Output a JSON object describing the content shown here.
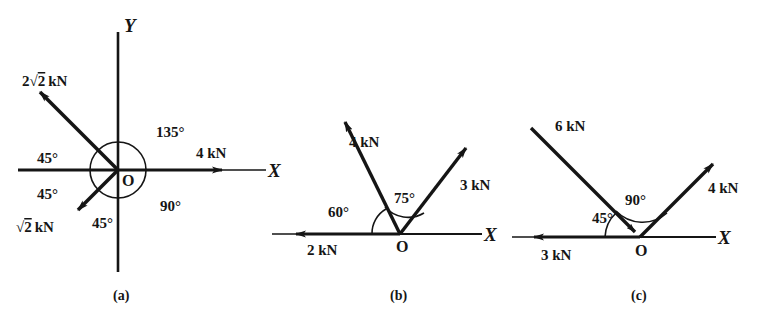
{
  "figure": {
    "units": "kN",
    "stroke_color": "#151515",
    "background": "#ffffff"
  },
  "panels": [
    {
      "id": "a",
      "caption": "(a)",
      "origin_label": "O",
      "axes": [
        {
          "name": "x-axis",
          "label": "X"
        },
        {
          "name": "y-axis",
          "label": "Y"
        }
      ],
      "forces": [
        {
          "name": "force-4kn",
          "magnitude": "4",
          "unit": "kN",
          "label_prefix": "",
          "radical": "",
          "label": "4 kN",
          "direction_deg": 0,
          "points_away": true
        },
        {
          "name": "force-2root2kn",
          "magnitude": "2",
          "unit": "kN",
          "label_prefix": "2",
          "radical": "2",
          "label": "2√2 kN",
          "direction_deg": 135,
          "points_away": true
        },
        {
          "name": "force-root2kn",
          "magnitude": "",
          "unit": "kN",
          "label_prefix": "",
          "radical": "2",
          "label": "√2 kN",
          "direction_deg": 225,
          "points_away": true
        }
      ],
      "angles": [
        {
          "name": "angle-135",
          "value": "135",
          "symbol": "°",
          "label": "135°"
        },
        {
          "name": "angle-90",
          "value": "90",
          "symbol": "°",
          "label": "90°"
        },
        {
          "name": "angle-45-upper-left",
          "value": "45",
          "symbol": "°",
          "label": "45°"
        },
        {
          "name": "angle-45-lower-left",
          "value": "45",
          "symbol": "°",
          "label": "45°"
        },
        {
          "name": "angle-45-bottom",
          "value": "45",
          "symbol": "°",
          "label": "45°"
        }
      ]
    },
    {
      "id": "b",
      "caption": "(b)",
      "origin_label": "O",
      "axes": [
        {
          "name": "x-axis",
          "label": "X"
        }
      ],
      "forces": [
        {
          "name": "force-2kn",
          "magnitude": "2",
          "unit": "kN",
          "label": "2 kN",
          "direction_deg": 180,
          "points_away": true
        },
        {
          "name": "force-4kn",
          "magnitude": "4",
          "unit": "kN",
          "label": "4 kN",
          "direction_deg": 120,
          "points_away": true
        },
        {
          "name": "force-3kn",
          "magnitude": "3",
          "unit": "kN",
          "label": "3 kN",
          "direction_deg": 45,
          "points_away": true
        }
      ],
      "angles": [
        {
          "name": "angle-60",
          "value": "60",
          "symbol": "°",
          "label": "60°"
        },
        {
          "name": "angle-75",
          "value": "75",
          "symbol": "°",
          "label": "75°"
        }
      ]
    },
    {
      "id": "c",
      "caption": "(c)",
      "origin_label": "O",
      "axes": [
        {
          "name": "x-axis",
          "label": "X"
        }
      ],
      "forces": [
        {
          "name": "force-3kn",
          "magnitude": "3",
          "unit": "kN",
          "label": "3 kN",
          "direction_deg": 180,
          "points_away": true
        },
        {
          "name": "force-6kn",
          "magnitude": "6",
          "unit": "kN",
          "label": "6 kN",
          "direction_deg": 135,
          "points_away": false
        },
        {
          "name": "force-4kn",
          "magnitude": "4",
          "unit": "kN",
          "label": "4 kN",
          "direction_deg": 45,
          "points_away": true
        }
      ],
      "angles": [
        {
          "name": "angle-45",
          "value": "45",
          "symbol": "°",
          "label": "45°"
        },
        {
          "name": "angle-90",
          "value": "90",
          "symbol": "°",
          "label": "90°"
        }
      ]
    }
  ]
}
